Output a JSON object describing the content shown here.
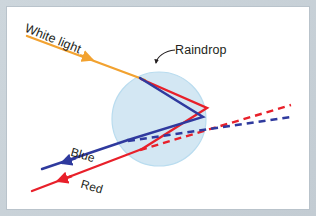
{
  "figure": {
    "background_color": "#ffffff",
    "frame_color": "#c9d2d8"
  },
  "labels": {
    "white_light": "White light",
    "raindrop": "Raindrop",
    "blue": "Blue",
    "red": "Red"
  },
  "colors": {
    "white_light_ray": "#f2a230",
    "red_ray": "#e8202a",
    "blue_ray": "#2f3a9e",
    "raindrop_fill": "#d3e7f3",
    "raindrop_stroke": "#b7d8ec",
    "text": "#231f20"
  },
  "diagram": {
    "raindrop": {
      "cx": 159,
      "cy": 119,
      "r": 47
    },
    "rays": [
      {
        "name": "white-light-incoming",
        "color": "#f2a230",
        "style": "solid",
        "arrow": true,
        "points": "27,36 140,78"
      },
      {
        "name": "blue-internal-first",
        "color": "#2f3a9e",
        "style": "solid",
        "points": "140,78 203,117"
      },
      {
        "name": "red-internal-first",
        "color": "#e8202a",
        "style": "solid",
        "points": "142,80 207,108"
      },
      {
        "name": "blue-internal-second",
        "color": "#2f3a9e",
        "style": "solid",
        "points": "203,117 128,140"
      },
      {
        "name": "red-internal-second",
        "color": "#e8202a",
        "style": "solid",
        "points": "207,108 142,149"
      },
      {
        "name": "blue-exit",
        "color": "#2f3a9e",
        "style": "solid",
        "arrow": true,
        "points": "128,140 40,170"
      },
      {
        "name": "red-exit",
        "color": "#e8202a",
        "style": "solid",
        "arrow": true,
        "points": "142,149 33,191"
      },
      {
        "name": "blue-virtual-dashed",
        "color": "#2f3a9e",
        "style": "dashed",
        "points": "128,140 290,117"
      },
      {
        "name": "red-virtual-dashed",
        "color": "#e8202a",
        "style": "dashed",
        "points": "142,149 290,105"
      }
    ],
    "pointer": {
      "name": "raindrop-pointer",
      "path": "M 174,51 C 165,52 158,57 156,64",
      "arrow_tip": "156,68"
    }
  }
}
